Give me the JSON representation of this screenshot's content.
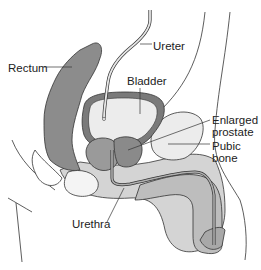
{
  "diagram": {
    "labels": {
      "rectum": "Rectum",
      "ureter": "Ureter",
      "bladder": "Bladder",
      "prostate_line1": "Enlarged",
      "prostate_line2": "prostate",
      "pubic_line1": "Pubic",
      "pubic_line2": "bone",
      "urethra": "Urethra"
    },
    "colors": {
      "rectum": "#8c8c8c",
      "bladder_wall": "#7a7a7a",
      "bladder_inner": "#ececec",
      "prostate": "#9a9a9a",
      "soft_tissue": "#d4d4d4",
      "pubic_bone": "#e8e8e8",
      "outline": "#333333",
      "background": "#ffffff"
    }
  }
}
